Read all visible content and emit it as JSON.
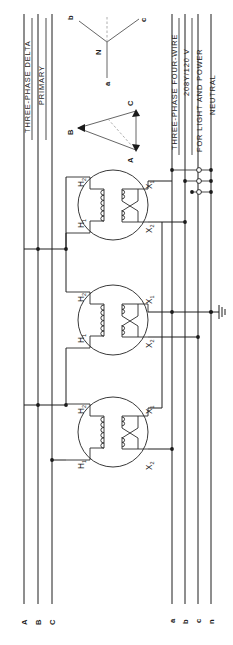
{
  "diagram": {
    "title_primary_side": [
      "THREE-PHASE DELTA",
      "PRIMARY"
    ],
    "title_secondary_side": [
      "THREE-PHASE FOUR-WIRE",
      "208Y/120 V",
      "FOR LIGHT AND POWER",
      "NEUTRAL"
    ],
    "primary_bus_labels": [
      "A",
      "B",
      "C"
    ],
    "secondary_bus_labels": [
      "a",
      "b",
      "c",
      "n"
    ],
    "vector_wye": {
      "center_label": "N",
      "tips": [
        "b",
        "c",
        "a"
      ]
    },
    "vector_delta": {
      "vertices": [
        "A",
        "B",
        "C"
      ]
    },
    "transformers": [
      {
        "primary_terminals": [
          "H2",
          "H1"
        ],
        "secondary_terminals": [
          "X1",
          "X2"
        ]
      },
      {
        "primary_terminals": [
          "H2",
          "H1"
        ],
        "secondary_terminals": [
          "X1",
          "X2"
        ]
      },
      {
        "primary_terminals": [
          "H2",
          "H1"
        ],
        "secondary_terminals": [
          "X1",
          "X2"
        ]
      }
    ],
    "ground_symbol": "earth-ground",
    "colors": {
      "ink": "#1f1f1f",
      "paper": "#ffffff",
      "vector_ink": "#555555"
    }
  }
}
